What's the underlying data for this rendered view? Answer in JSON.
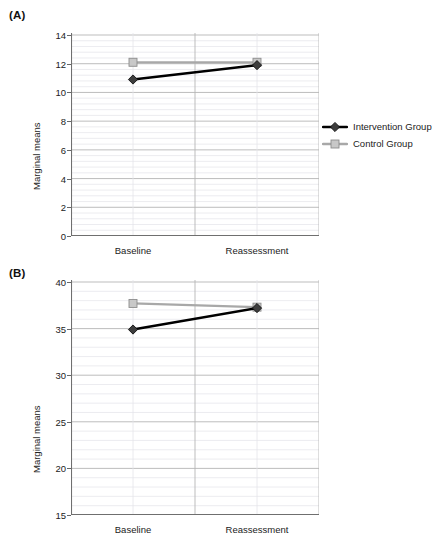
{
  "figure": {
    "panels": [
      {
        "id": "A",
        "label": "(A)",
        "ylabel": "Marginal means"
      },
      {
        "id": "B",
        "label": "(B)",
        "ylabel": "Marginal means"
      }
    ]
  },
  "chart_data": [
    {
      "type": "line",
      "panel": "(A)",
      "title": "",
      "xlabel": "",
      "ylabel": "Marginal means",
      "categories": [
        "Baseline",
        "Reassessment"
      ],
      "x_ticklabels": [
        "Baseline",
        "Reassessment"
      ],
      "y_ticklabels": [
        "0",
        "2",
        "4",
        "6",
        "8",
        "10",
        "12",
        "14"
      ],
      "yticks": [
        0,
        2,
        4,
        6,
        8,
        10,
        12,
        14
      ],
      "ylim": [
        0,
        14
      ],
      "grid": true,
      "minor_grid": true,
      "legend_position": "right",
      "series": [
        {
          "name": "Intervention Group",
          "values": [
            10.9,
            11.9
          ],
          "color": "#000000",
          "marker": "diamond",
          "marker_color": "#3d3d3d"
        },
        {
          "name": "Control Group",
          "values": [
            12.1,
            12.1
          ],
          "color": "#a8a8a8",
          "marker": "square",
          "marker_color": "#c8c8c8"
        }
      ]
    },
    {
      "type": "line",
      "panel": "(B)",
      "title": "",
      "xlabel": "",
      "ylabel": "Marginal means",
      "categories": [
        "Baseline",
        "Reassessment"
      ],
      "x_ticklabels": [
        "Baseline",
        "Reassessment"
      ],
      "y_ticklabels": [
        "15",
        "20",
        "25",
        "30",
        "35",
        "40"
      ],
      "yticks": [
        15,
        20,
        25,
        30,
        35,
        40
      ],
      "ylim": [
        15,
        40
      ],
      "grid": true,
      "minor_grid": true,
      "legend_position": "right",
      "series": [
        {
          "name": "Intervention Group",
          "values": [
            34.9,
            37.2
          ],
          "color": "#000000",
          "marker": "diamond",
          "marker_color": "#3d3d3d"
        },
        {
          "name": "Control Group",
          "values": [
            37.7,
            37.3
          ],
          "color": "#a8a8a8",
          "marker": "square",
          "marker_color": "#c8c8c8"
        }
      ]
    }
  ],
  "colors": {
    "intervention": "#000000",
    "control": "#a8a8a8",
    "axis": "#6f6f6f",
    "grid_major": "#b5b5b5",
    "grid_minor": "#e4e4ea",
    "text": "#222222",
    "background": "#ffffff"
  }
}
